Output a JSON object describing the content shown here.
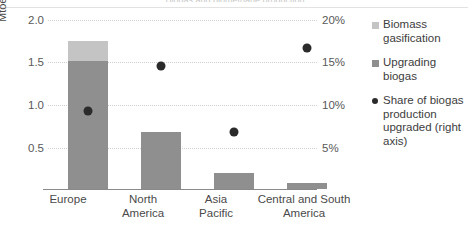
{
  "title_sliver": "Biogas and biomethane production",
  "axes": {
    "left_axis_title": "Mtoe",
    "left_ticks": [
      "2.0",
      "1.5",
      "1.0",
      "0.5"
    ],
    "right_ticks": [
      "20%",
      "15%",
      "10%",
      "5%"
    ]
  },
  "legend": {
    "items": [
      {
        "label": "Biomass gasification",
        "marker": "square-swatch-light",
        "color": "#c4c4c4"
      },
      {
        "label": "Upgrading biogas",
        "marker": "square-swatch-dark",
        "color": "#8f8f8f"
      },
      {
        "label": "Share of biogas production upgraded (right axis)",
        "marker": "round-dot",
        "color": "#2b2b2b"
      }
    ]
  },
  "chart_data": {
    "type": "bar",
    "title": "Biogas and biomethane production",
    "xlabel": "",
    "ylabel": "Mtoe",
    "ylim": [
      0,
      2.0
    ],
    "y2lim": [
      0,
      20
    ],
    "y2label": "%",
    "grid": true,
    "legend_position": "right",
    "categories": [
      "Europe",
      "North America",
      "Asia Pacific",
      "Central and South America"
    ],
    "series": [
      {
        "name": "Upgrading biogas",
        "type": "bar",
        "stack": "total",
        "color": "#8f8f8f",
        "axis": "left",
        "unit": "Mtoe",
        "values": [
          1.52,
          0.67,
          0.19,
          0.07
        ]
      },
      {
        "name": "Biomass gasification",
        "type": "bar",
        "stack": "total",
        "color": "#c4c4c4",
        "axis": "left",
        "unit": "Mtoe",
        "values": [
          0.23,
          0.0,
          0.0,
          0.0
        ]
      },
      {
        "name": "Share of biogas production upgraded (right axis)",
        "type": "scatter",
        "color": "#2b2b2b",
        "axis": "right",
        "unit": "%",
        "values": [
          9.2,
          14.5,
          6.7,
          16.7
        ]
      }
    ],
    "bar_totals": [
      1.75,
      0.67,
      0.19,
      0.07
    ]
  }
}
